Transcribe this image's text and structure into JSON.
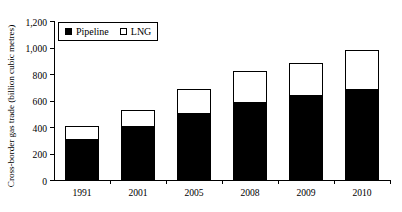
{
  "chart_data": {
    "type": "bar",
    "stacked": true,
    "title": "",
    "xlabel": "",
    "ylabel": "Cross-border gas trade (billion cubic metres)",
    "categories": [
      "1991",
      "2001",
      "2005",
      "2008",
      "2009",
      "2010"
    ],
    "series": [
      {
        "name": "Pipeline",
        "color": "#000000",
        "values": [
          300,
          400,
          500,
          585,
          635,
          680
        ]
      },
      {
        "name": "LNG",
        "color": "#ffffff",
        "values": [
          105,
          125,
          190,
          235,
          245,
          305
        ]
      }
    ],
    "totals": [
      405,
      525,
      690,
      820,
      880,
      985
    ],
    "ylim": [
      0,
      1200
    ],
    "yticks": [
      0,
      200,
      400,
      600,
      800,
      1000,
      1200
    ],
    "ytick_labels": [
      "0",
      "200",
      "400",
      "600",
      "800",
      "1,000",
      "1,200"
    ],
    "grid": false,
    "legend_position": "top-left",
    "legend": [
      {
        "label": "Pipeline",
        "swatch": "filled-square"
      },
      {
        "label": "LNG",
        "swatch": "hollow-square"
      }
    ]
  }
}
